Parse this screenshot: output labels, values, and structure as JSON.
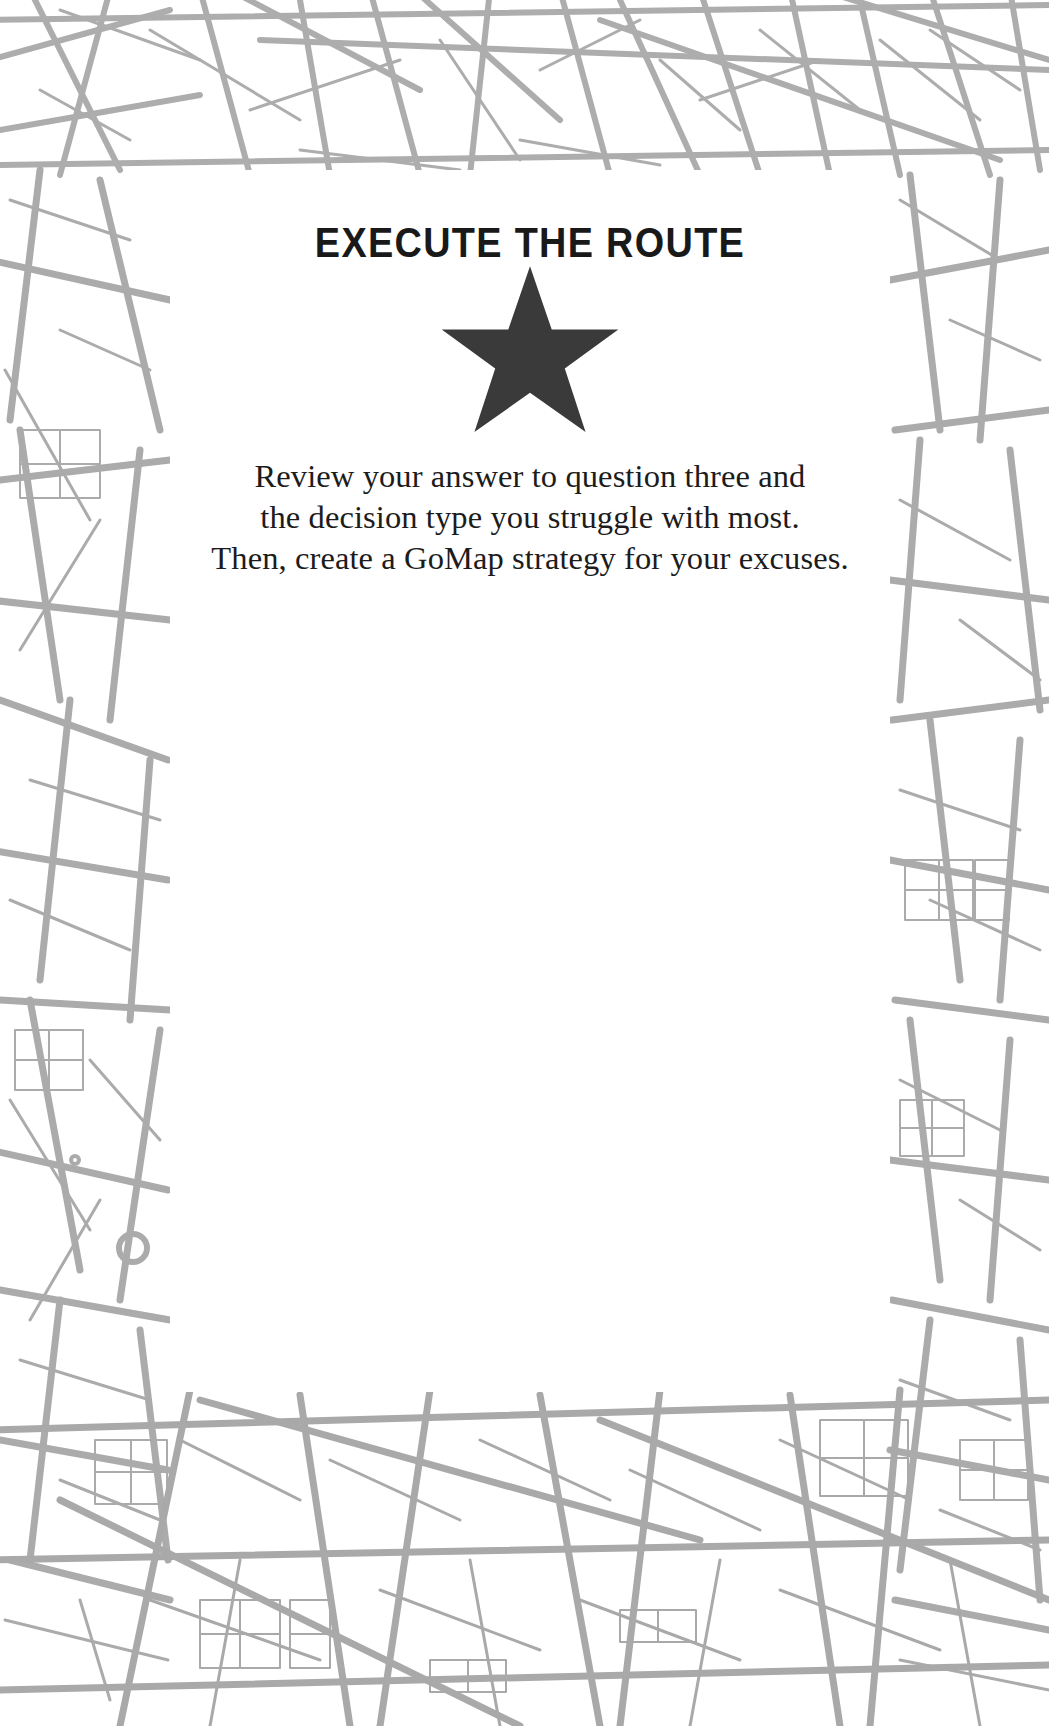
{
  "page": {
    "background_color": "#ffffff",
    "card_background": "#ffffff",
    "map_line_color": "#aaaaaa"
  },
  "card": {
    "title": "EXECUTE THE ROUTE",
    "title_color": "#191919",
    "divider_icon": "star-icon",
    "star_color": "#3a3a3a",
    "body_lines": [
      "Review your answer to question three and",
      "the decision type you struggle with most.",
      "Then, create a GoMap strategy for your excuses."
    ],
    "body_color": "#1c1c1c"
  }
}
